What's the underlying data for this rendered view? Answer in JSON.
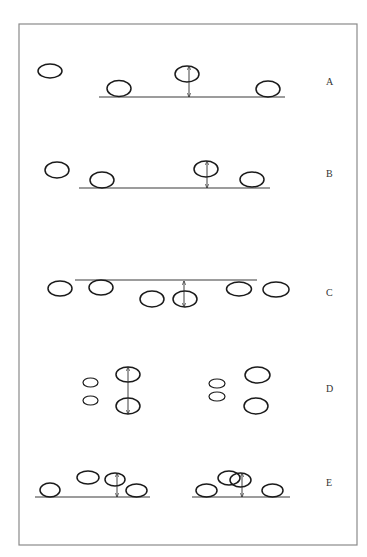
{
  "figure": {
    "frame": {
      "x": 19,
      "y": 24,
      "w": 338,
      "h": 521
    },
    "colors": {
      "stroke": "#1a1a1a",
      "frame": "#8a8a8a",
      "label": "#333333"
    },
    "panels": [
      {
        "label": "A",
        "label_pos": {
          "x": 326,
          "y": 85
        },
        "baselines": [
          {
            "x1": 99,
            "x2": 285,
            "y": 97
          }
        ],
        "ellipses": [
          {
            "cx": 50,
            "cy": 71,
            "rx": 12,
            "ry": 7
          },
          {
            "cx": 119,
            "cy": 88.5,
            "rx": 12,
            "ry": 8
          },
          {
            "cx": 187,
            "cy": 74,
            "rx": 12,
            "ry": 8
          },
          {
            "cx": 268,
            "cy": 89,
            "rx": 12,
            "ry": 8
          }
        ],
        "arrows": [
          {
            "x": 189,
            "y1": 66,
            "y2": 97
          }
        ]
      },
      {
        "label": "B",
        "label_pos": {
          "x": 326,
          "y": 177
        },
        "baselines": [
          {
            "x1": 79,
            "x2": 270,
            "y": 188
          }
        ],
        "ellipses": [
          {
            "cx": 57,
            "cy": 170,
            "rx": 12,
            "ry": 8
          },
          {
            "cx": 102,
            "cy": 180,
            "rx": 12,
            "ry": 8
          },
          {
            "cx": 206,
            "cy": 169,
            "rx": 12,
            "ry": 8
          },
          {
            "cx": 252,
            "cy": 179.5,
            "rx": 12,
            "ry": 7.5
          }
        ],
        "arrows": [
          {
            "x": 207,
            "y1": 161,
            "y2": 188
          }
        ]
      },
      {
        "label": "C",
        "label_pos": {
          "x": 326,
          "y": 296
        },
        "baselines": [
          {
            "x1": 75,
            "x2": 257,
            "y": 280
          }
        ],
        "ellipses": [
          {
            "cx": 60,
            "cy": 288.5,
            "rx": 12,
            "ry": 7.5
          },
          {
            "cx": 101,
            "cy": 287.5,
            "rx": 12,
            "ry": 7.5
          },
          {
            "cx": 152,
            "cy": 299,
            "rx": 12,
            "ry": 8
          },
          {
            "cx": 185,
            "cy": 299,
            "rx": 12,
            "ry": 8
          },
          {
            "cx": 239,
            "cy": 289,
            "rx": 12.5,
            "ry": 7
          },
          {
            "cx": 276,
            "cy": 289.5,
            "rx": 13,
            "ry": 7.5
          }
        ],
        "arrows": [
          {
            "x": 184,
            "y1": 281,
            "y2": 307
          }
        ]
      },
      {
        "label": "D",
        "label_pos": {
          "x": 326,
          "y": 392
        },
        "baselines": [],
        "ellipses": [
          {
            "cx": 90.5,
            "cy": 382.5,
            "rx": 7.5,
            "ry": 4.5,
            "thin": true
          },
          {
            "cx": 90.5,
            "cy": 400.5,
            "rx": 7.5,
            "ry": 4.5,
            "thin": true
          },
          {
            "cx": 128,
            "cy": 374.5,
            "rx": 12,
            "ry": 7.5
          },
          {
            "cx": 128,
            "cy": 406,
            "rx": 12,
            "ry": 8
          },
          {
            "cx": 217,
            "cy": 383.5,
            "rx": 8,
            "ry": 4.5,
            "thin": true
          },
          {
            "cx": 217,
            "cy": 396.5,
            "rx": 8,
            "ry": 4.5,
            "thin": true
          },
          {
            "cx": 257.5,
            "cy": 375,
            "rx": 12.5,
            "ry": 8
          },
          {
            "cx": 256,
            "cy": 406,
            "rx": 12,
            "ry": 8
          }
        ],
        "arrows": [
          {
            "x": 128,
            "y1": 367,
            "y2": 414
          }
        ]
      },
      {
        "label": "E",
        "label_pos": {
          "x": 326,
          "y": 486
        },
        "baselines": [
          {
            "x1": 35,
            "x2": 150,
            "y": 497
          },
          {
            "x1": 192,
            "x2": 290,
            "y": 497
          }
        ],
        "ellipses": [
          {
            "cx": 50,
            "cy": 490,
            "rx": 10,
            "ry": 7
          },
          {
            "cx": 88,
            "cy": 477.5,
            "rx": 11,
            "ry": 6.5
          },
          {
            "cx": 115,
            "cy": 479.5,
            "rx": 10,
            "ry": 6.5
          },
          {
            "cx": 136.5,
            "cy": 490.5,
            "rx": 10.5,
            "ry": 6.5
          },
          {
            "cx": 206.5,
            "cy": 490.5,
            "rx": 10.5,
            "ry": 6.5
          },
          {
            "cx": 229,
            "cy": 478,
            "rx": 11,
            "ry": 7
          },
          {
            "cx": 240.5,
            "cy": 480,
            "rx": 10.5,
            "ry": 7
          },
          {
            "cx": 272.5,
            "cy": 490.5,
            "rx": 10.5,
            "ry": 6.5
          }
        ],
        "arrows": [
          {
            "x": 117,
            "y1": 473,
            "y2": 497
          },
          {
            "x": 242,
            "y1": 473,
            "y2": 497
          }
        ]
      }
    ]
  }
}
